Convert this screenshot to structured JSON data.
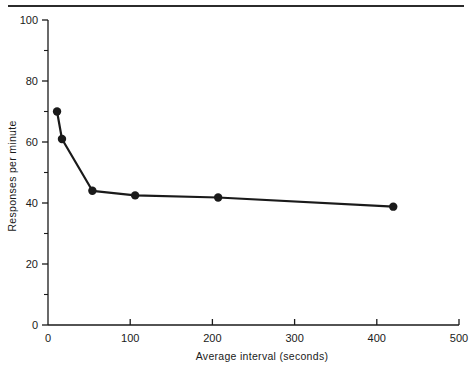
{
  "chart_data": {
    "type": "line",
    "title": "",
    "xlabel": "Average interval  (seconds)",
    "ylabel": "Responses per minute",
    "xlim": [
      0,
      500
    ],
    "ylim": [
      0,
      100
    ],
    "x_ticks": [
      0,
      100,
      200,
      300,
      400,
      500
    ],
    "x_tick_labels": [
      "0",
      "100",
      "200",
      "300",
      "400",
      "500"
    ],
    "y_ticks": [
      0,
      20,
      40,
      60,
      80,
      100
    ],
    "y_tick_labels": [
      "0",
      "20",
      "40",
      "60",
      "80",
      "100"
    ],
    "y_minor_ticks": [
      10,
      30,
      50,
      70,
      90
    ],
    "grid": false,
    "legend": null,
    "marker": "filled-circle",
    "line_color": "#1a1a1a",
    "series": [
      {
        "name": "Responses per minute vs average interval",
        "x": [
          11,
          17,
          54,
          106,
          207,
          420
        ],
        "y": [
          70,
          61,
          44,
          42.5,
          41.8,
          38.8
        ]
      }
    ]
  },
  "figure": {
    "top_rule": true,
    "background": "#ffffff"
  }
}
